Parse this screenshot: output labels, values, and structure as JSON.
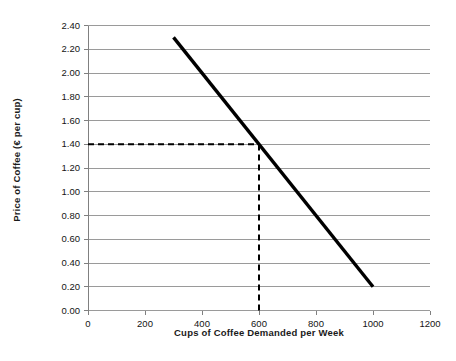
{
  "chart_data": {
    "type": "line",
    "title": "",
    "xlabel": "Cups of Coffee Demanded per Week",
    "ylabel": "Price of Coffee (€ per cup)",
    "xlim": [
      0,
      1200
    ],
    "ylim": [
      0.0,
      2.4
    ],
    "grid": true,
    "legend": "none",
    "x_ticks": [
      "0",
      "200",
      "400",
      "600",
      "800",
      "1000",
      "1200"
    ],
    "x_tick_values": [
      0,
      200,
      400,
      600,
      800,
      1000,
      1200
    ],
    "y_ticks": [
      "0.00",
      "0.20",
      "0.40",
      "0.60",
      "0.80",
      "1.00",
      "1.20",
      "1.40",
      "1.60",
      "1.80",
      "2.00",
      "2.20",
      "2.40"
    ],
    "y_tick_values": [
      0.0,
      0.2,
      0.4,
      0.6,
      0.8,
      1.0,
      1.2,
      1.4,
      1.6,
      1.8,
      2.0,
      2.2,
      2.4
    ],
    "series": [
      {
        "name": "Demand curve",
        "type": "line",
        "x": [
          300,
          1000
        ],
        "y": [
          2.3,
          0.2
        ],
        "color": "#000000",
        "width": 3.4
      }
    ],
    "annotations": [
      {
        "name": "equilibrium-price-guide",
        "type": "dashed-horizontal",
        "y": 1.4,
        "x_from": 0,
        "x_to": 600,
        "color": "#000000"
      },
      {
        "name": "equilibrium-quantity-guide",
        "type": "dashed-vertical",
        "x": 600,
        "y_from": 0.0,
        "y_to": 1.4,
        "color": "#000000"
      }
    ],
    "colors": {
      "background": "#ffffff",
      "gridline": "#9a9a9a",
      "axis": "#808080",
      "curve": "#000000",
      "guide": "#000000",
      "text": "#141414"
    }
  }
}
